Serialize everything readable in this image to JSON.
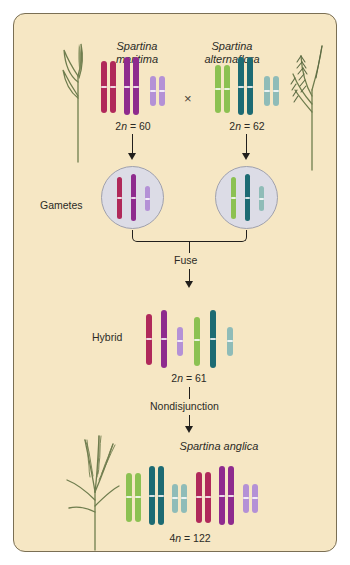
{
  "figure": {
    "background_color": "#f6e7c4",
    "border_color": "#7a6f54"
  },
  "parents": {
    "left": {
      "name_line1": "Spartina",
      "name_line2": "maritima",
      "ploidy": "2n = 60",
      "ploidy_prefix": "2",
      "ploidy_italic": "n",
      "ploidy_suffix": " = 60",
      "chromosomes": [
        {
          "color": "#b0295a",
          "type": "crimson",
          "count": 2,
          "length": "long"
        },
        {
          "color": "#8e2b8e",
          "type": "purple",
          "count": 2,
          "length": "long"
        },
        {
          "color": "#b491d6",
          "type": "lavender",
          "count": 2,
          "length": "short"
        }
      ]
    },
    "right": {
      "name_line1": "Spartina",
      "name_line2": "alternaflora",
      "ploidy": "2n = 62",
      "ploidy_prefix": "2",
      "ploidy_italic": "n",
      "ploidy_suffix": " = 62",
      "chromosomes": [
        {
          "color": "#8cc152",
          "type": "green",
          "count": 2,
          "length": "long"
        },
        {
          "color": "#1d6b73",
          "type": "teal",
          "count": 2,
          "length": "long"
        },
        {
          "color": "#8fbcb8",
          "type": "pale-teal",
          "count": 2,
          "length": "short"
        }
      ]
    },
    "cross_symbol": "×"
  },
  "gametes": {
    "label": "Gametes",
    "left_chromosomes": [
      {
        "color": "#b0295a",
        "length": "long"
      },
      {
        "color": "#8e2b8e",
        "length": "long"
      },
      {
        "color": "#b491d6",
        "length": "short"
      }
    ],
    "right_chromosomes": [
      {
        "color": "#8cc152",
        "length": "long"
      },
      {
        "color": "#1d6b73",
        "length": "long"
      },
      {
        "color": "#8fbcb8",
        "length": "short"
      }
    ]
  },
  "fuse": {
    "label": "Fuse"
  },
  "hybrid": {
    "label": "Hybrid",
    "ploidy": "2n = 61",
    "ploidy_prefix": "2",
    "ploidy_italic": "n",
    "ploidy_suffix": " = 61",
    "chromosomes": [
      {
        "color": "#b0295a",
        "length": "long"
      },
      {
        "color": "#8e2b8e",
        "length": "long"
      },
      {
        "color": "#b491d6",
        "length": "short"
      },
      {
        "color": "#8cc152",
        "length": "long"
      },
      {
        "color": "#1d6b73",
        "length": "long"
      },
      {
        "color": "#8fbcb8",
        "length": "short"
      }
    ]
  },
  "nondisjunction": {
    "label": "Nondisjunction"
  },
  "offspring": {
    "name": "Spartina anglica",
    "ploidy": "4n = 122",
    "ploidy_prefix": "4",
    "ploidy_italic": "n",
    "ploidy_suffix": " = 122",
    "chromosomes": [
      {
        "color": "#8cc152",
        "count": 2,
        "length": "long"
      },
      {
        "color": "#1d6b73",
        "count": 2,
        "length": "long"
      },
      {
        "color": "#8fbcb8",
        "count": 2,
        "length": "short"
      },
      {
        "color": "#b0295a",
        "count": 2,
        "length": "long"
      },
      {
        "color": "#8e2b8e",
        "count": 2,
        "length": "long"
      },
      {
        "color": "#b491d6",
        "count": 2,
        "length": "short"
      }
    ]
  },
  "plants": {
    "left_top": "spartina-maritima-plant",
    "right_top": "spartina-alternaflora-plant",
    "bottom_left": "spartina-anglica-plant",
    "stem_color": "#6f7d4e"
  }
}
